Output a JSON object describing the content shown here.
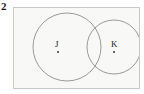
{
  "figure": {
    "number": "2",
    "type": "venn-diagram",
    "universal_set_shape": "rectangle"
  },
  "sets": [
    {
      "id": "J",
      "label": "J",
      "has_point": true,
      "point_label": ""
    },
    {
      "id": "K",
      "label": "K",
      "has_point": true,
      "point_label": ""
    }
  ],
  "colors": {
    "background": "#ffffff",
    "panel_background": "#f8f8f6",
    "frame_border": "#c9c9c6",
    "circle_stroke": "#8e8e8e",
    "label_text": "#1c1c1c",
    "number_text": "#1a1a1a",
    "point_fill": "#3a3a3a"
  }
}
